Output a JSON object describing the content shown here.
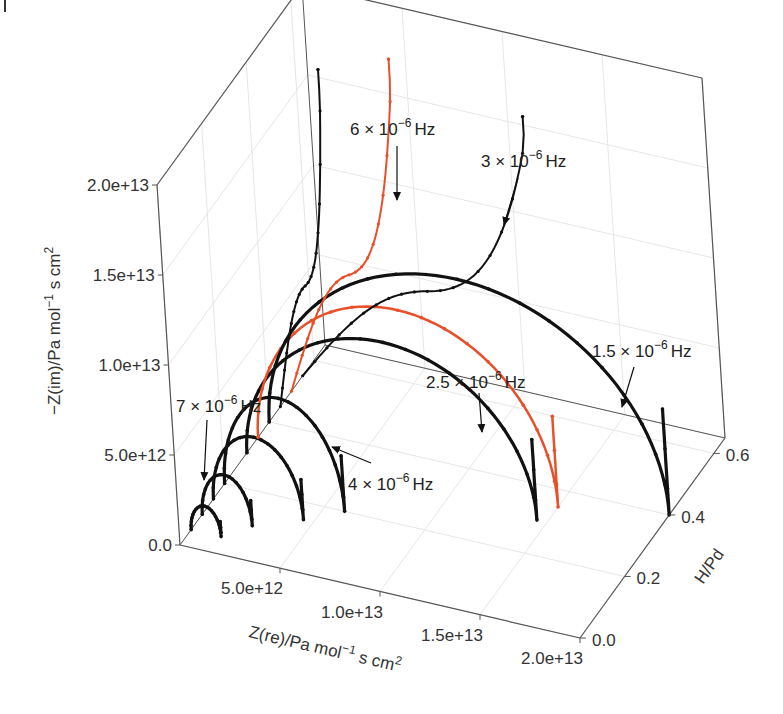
{
  "chart_data": {
    "type": "line3d",
    "title": "",
    "axes": {
      "x": {
        "label": "Z(re)/Pa mol⁻¹ s cm²",
        "label_text": "Z(re)/Pa mol",
        "label_sup": "−1",
        "label_tail": " s cm",
        "label_sup2": "2",
        "range": [
          0,
          20000000000000.0
        ],
        "ticks": [
          5000000000000.0,
          10000000000000.0,
          15000000000000.0,
          20000000000000.0
        ],
        "tick_labels": [
          "5.0e+12",
          "1.0e+13",
          "1.5e+13",
          "2.0e+13"
        ]
      },
      "y": {
        "label": "H/Pd",
        "range": [
          0,
          0.65
        ],
        "ticks": [
          0.0,
          0.2,
          0.4,
          0.6
        ],
        "tick_labels": [
          "0.0",
          "0.2",
          "0.4",
          "0.6"
        ]
      },
      "z": {
        "label": "−Z(im)/Pa mol⁻¹ s cm²",
        "label_text": "−Z(im)/Pa mol",
        "label_sup": "−1",
        "label_tail": " s cm",
        "label_sup2": "2",
        "range": [
          0,
          20000000000000.0
        ],
        "ticks": [
          0.0,
          5000000000000.0,
          10000000000000.0,
          15000000000000.0,
          20000000000000.0
        ],
        "tick_labels": [
          "0.0",
          "5.0e+12",
          "1.0e+13",
          "1.5e+13",
          "2.0e+13"
        ]
      }
    },
    "grid": true,
    "series_colors": {
      "black": "#111111",
      "orange": "#e8502a"
    },
    "series": [
      {
        "name": "7e-6 Hz group (low H/Pd arcs)",
        "color": "black",
        "h_pd": 0.05,
        "zre_max": 1500000000000.0,
        "zim_peak": 1500000000000.0
      },
      {
        "name": "arc",
        "color": "black",
        "h_pd": 0.1,
        "zre_max": 2500000000000.0,
        "zim_peak": 2500000000000.0
      },
      {
        "name": "4e-6 Hz",
        "color": "black",
        "h_pd": 0.15,
        "zre_max": 4500000000000.0,
        "zim_peak": 4000000000000.0
      },
      {
        "name": "arc",
        "color": "black",
        "h_pd": 0.2,
        "zre_max": 6000000000000.0,
        "zim_peak": 5500000000000.0
      },
      {
        "name": "2.5e-6 Hz",
        "color": "black",
        "h_pd": 0.3,
        "zre_max": 14500000000000.0,
        "zim_peak": 8000000000000.0
      },
      {
        "name": "orange arc",
        "color": "orange",
        "h_pd": 0.35,
        "zre_max": 15000000000000.0,
        "zim_peak": 9000000000000.0
      },
      {
        "name": "1.5e-6 Hz",
        "color": "black",
        "h_pd": 0.4,
        "zre_max": 20000000000000.0,
        "zim_peak": 10500000000000.0
      },
      {
        "name": "3e-6 Hz",
        "color": "black",
        "h_pd": 0.55,
        "zre_max": 12000000000000.0,
        "zim_end": 17500000000000.0
      },
      {
        "name": "orange tail",
        "color": "orange",
        "h_pd": 0.5,
        "zre_max": 6000000000000.0,
        "zim_end": 20000000000000.0
      },
      {
        "name": "6e-6 Hz",
        "color": "black",
        "h_pd": 0.45,
        "zre_max": 3000000000000.0,
        "zim_end": 19500000000000.0
      }
    ],
    "annotations": [
      {
        "base": "6",
        "exp": "−6",
        "unit": "Hz"
      },
      {
        "base": "3",
        "exp": "−6",
        "unit": "Hz"
      },
      {
        "base": "1.5",
        "exp": "−6",
        "unit": "Hz"
      },
      {
        "base": "2.5",
        "exp": "−6",
        "unit": "Hz"
      },
      {
        "base": "4",
        "exp": "−6",
        "unit": "Hz"
      },
      {
        "base": "7",
        "exp": "−6",
        "unit": "Hz"
      }
    ]
  }
}
